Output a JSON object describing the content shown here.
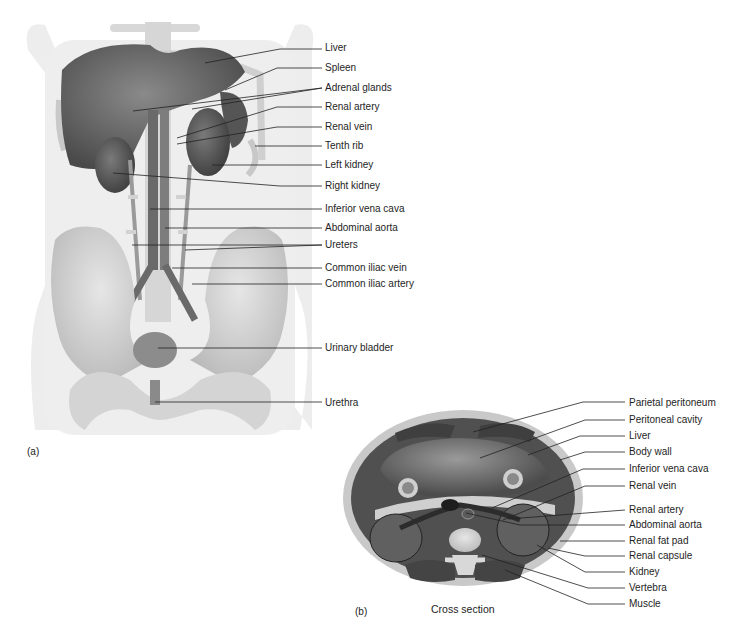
{
  "figure_a": {
    "panel_label": "(a)",
    "labels": [
      {
        "text": "Liver",
        "y": 48
      },
      {
        "text": "Spleen",
        "y": 68
      },
      {
        "text": "Adrenal glands",
        "y": 88
      },
      {
        "text": "Renal artery",
        "y": 107
      },
      {
        "text": "Renal vein",
        "y": 127
      },
      {
        "text": "Tenth rib",
        "y": 146
      },
      {
        "text": "Left kidney",
        "y": 165
      },
      {
        "text": "Right kidney",
        "y": 186
      },
      {
        "text": "Inferior vena cava",
        "y": 209
      },
      {
        "text": "Abdominal aorta",
        "y": 228
      },
      {
        "text": "Ureters",
        "y": 245
      },
      {
        "text": "Common iliac vein",
        "y": 268
      },
      {
        "text": "Common iliac artery",
        "y": 284
      },
      {
        "text": "Urinary bladder",
        "y": 348
      },
      {
        "text": "Urethra",
        "y": 403
      }
    ]
  },
  "figure_b": {
    "panel_label": "(b)",
    "caption": "Cross section",
    "labels": [
      {
        "text": "Parietal peritoneum",
        "y": 403
      },
      {
        "text": "Peritoneal cavity",
        "y": 420
      },
      {
        "text": "Liver",
        "y": 436
      },
      {
        "text": "Body wall",
        "y": 452
      },
      {
        "text": "Inferior vena cava",
        "y": 469
      },
      {
        "text": "Renal vein",
        "y": 486
      },
      {
        "text": "Renal artery",
        "y": 510
      },
      {
        "text": "Abdominal aorta",
        "y": 525
      },
      {
        "text": "Renal fat pad",
        "y": 541
      },
      {
        "text": "Renal capsule",
        "y": 556
      },
      {
        "text": "Kidney",
        "y": 572
      },
      {
        "text": "Vertebra",
        "y": 588
      },
      {
        "text": "Muscle",
        "y": 604
      }
    ]
  }
}
